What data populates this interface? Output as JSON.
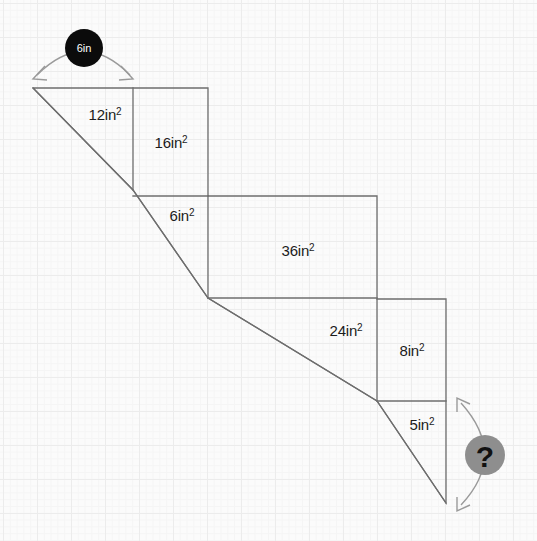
{
  "figure": {
    "units": "in",
    "stroke_color": "#6e6e6e",
    "grid_color": "#ececec",
    "background_color": "#fbfbfb"
  },
  "known_dimension": {
    "name": "top-width-badge",
    "label": "6in",
    "value": 6,
    "unit": "in",
    "badge_color": "#0b0b0b",
    "text_color": "#ffffff",
    "arc_color": "#9a9a9a",
    "circle": {
      "cx": 84,
      "cy": 48,
      "r": 19
    },
    "arc": {
      "x1": 36,
      "y1": 76,
      "x2": 131,
      "y2": 76,
      "peak_y": 40
    }
  },
  "unknown_dimension": {
    "name": "right-height-badge",
    "label": "?",
    "badge_color": "#8e8e8e",
    "text_color": "#111111",
    "arc_color": "#9a9a9a",
    "circle": {
      "cx": 485,
      "cy": 455,
      "r": 20
    },
    "arc": {
      "x1": 459,
      "y1": 404,
      "x2": 459,
      "y2": 505,
      "peak_x": 505
    }
  },
  "area_labels": [
    {
      "name": "area-label-12",
      "text": "12in",
      "exponent": "2",
      "value": 12,
      "unit": "in2",
      "x": 105,
      "y": 120,
      "anchor": "middle"
    },
    {
      "name": "area-label-16",
      "text": "16in",
      "exponent": "2",
      "value": 16,
      "unit": "in2",
      "x": 171,
      "y": 148,
      "anchor": "middle"
    },
    {
      "name": "area-label-6",
      "text": "6in",
      "exponent": "2",
      "value": 6,
      "unit": "in2",
      "x": 182,
      "y": 221,
      "anchor": "middle"
    },
    {
      "name": "area-label-36",
      "text": "36in",
      "exponent": "2",
      "value": 36,
      "unit": "in2",
      "x": 298,
      "y": 256,
      "anchor": "middle"
    },
    {
      "name": "area-label-24",
      "text": "24in",
      "exponent": "2",
      "value": 24,
      "unit": "in2",
      "x": 346,
      "y": 336,
      "anchor": "middle"
    },
    {
      "name": "area-label-8",
      "text": "8in",
      "exponent": "2",
      "value": 8,
      "unit": "in2",
      "x": 412,
      "y": 356,
      "anchor": "middle"
    },
    {
      "name": "area-label-5",
      "text": "5in",
      "exponent": "2",
      "value": 5,
      "unit": "in2",
      "x": 422,
      "y": 430,
      "anchor": "middle"
    }
  ],
  "outline": {
    "name": "staircase-outline",
    "points": "33,88 208,88 208,196 377,196 377,299 446,299 446,503 377,401 208,298 133,190 33,88"
  },
  "internal_segments": [
    {
      "name": "divider-vertical-left",
      "x1": 133,
      "y1": 88,
      "x2": 133,
      "y2": 190
    },
    {
      "name": "divider-horizontal-top",
      "x1": 133,
      "y1": 196,
      "x2": 208,
      "y2": 196
    },
    {
      "name": "divider-vertical-mid",
      "x1": 208,
      "y1": 196,
      "x2": 208,
      "y2": 298
    },
    {
      "name": "divider-horizontal-mid",
      "x1": 208,
      "y1": 298,
      "x2": 377,
      "y2": 298
    },
    {
      "name": "divider-vertical-right",
      "x1": 377,
      "y1": 299,
      "x2": 377,
      "y2": 401
    },
    {
      "name": "divider-horizontal-low",
      "x1": 377,
      "y1": 401,
      "x2": 446,
      "y2": 401
    }
  ],
  "diagonal": {
    "name": "staircase-diagonal",
    "points": "33,88 133,190 208,298 377,401 446,503"
  }
}
